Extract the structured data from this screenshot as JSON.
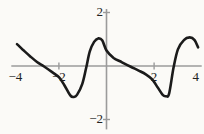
{
  "figure": {
    "background": "#fbfaf7"
  },
  "chart_data": {
    "type": "line",
    "title": "",
    "xlabel": "",
    "ylabel": "",
    "grid": false,
    "legend": null,
    "axis_color": "#9b9b9b",
    "label_color": "#222222",
    "x_axis": {
      "range": [
        -4,
        4
      ],
      "tick_values": [
        -2,
        2
      ],
      "tick_labels": [
        "−2",
        "2"
      ],
      "end_labels": [
        {
          "value": -4,
          "label": "−4"
        },
        {
          "value": 4,
          "label": "4"
        }
      ]
    },
    "y_axis": {
      "range": [
        -2.37,
        2.13
      ],
      "tick_values": [
        2,
        -2
      ],
      "tick_labels": [
        "2",
        "−2"
      ]
    },
    "series": [
      {
        "name": "function-curve",
        "color": "#1b1b1b",
        "stroke_width": 2.6,
        "points": [
          [
            -3.76,
            0.82
          ],
          [
            -3.5,
            0.6
          ],
          [
            -3.2,
            0.36
          ],
          [
            -2.92,
            0.15
          ],
          [
            -2.62,
            -0.02
          ],
          [
            -2.3,
            -0.22
          ],
          [
            -2.0,
            -0.42
          ],
          [
            -1.78,
            -0.7
          ],
          [
            -1.52,
            -1.1
          ],
          [
            -1.38,
            -1.16
          ],
          [
            -1.24,
            -1.08
          ],
          [
            -1.02,
            -0.68
          ],
          [
            -0.85,
            -0.05
          ],
          [
            -0.7,
            0.55
          ],
          [
            -0.52,
            0.9
          ],
          [
            -0.35,
            1.03
          ],
          [
            -0.18,
            0.96
          ],
          [
            0.0,
            0.58
          ],
          [
            0.3,
            0.3
          ],
          [
            0.65,
            0.14
          ],
          [
            1.0,
            -0.02
          ],
          [
            1.33,
            -0.16
          ],
          [
            1.65,
            -0.31
          ],
          [
            1.92,
            -0.5
          ],
          [
            2.15,
            -0.8
          ],
          [
            2.36,
            -1.08
          ],
          [
            2.5,
            -1.13
          ],
          [
            2.63,
            -1.03
          ],
          [
            2.82,
            -0.05
          ],
          [
            3.0,
            0.62
          ],
          [
            3.25,
            0.97
          ],
          [
            3.5,
            1.07
          ],
          [
            3.7,
            0.97
          ],
          [
            3.85,
            0.7
          ]
        ]
      }
    ]
  }
}
